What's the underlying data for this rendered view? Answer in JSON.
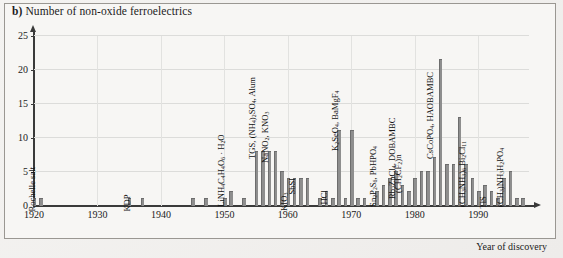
{
  "figure": {
    "panel_letter": "b)",
    "title": "Number of non-oxide ferroelectrics",
    "xaxis_title": "Year of discovery"
  },
  "chart_data": {
    "type": "bar",
    "title": "b) Number of non-oxide ferroelectrics",
    "xlabel": "Year of discovery",
    "ylabel": "Number of non-oxide ferroelectrics",
    "xlim": [
      1920,
      1998
    ],
    "ylim": [
      0,
      25
    ],
    "yticks": [
      0,
      5,
      10,
      15,
      20,
      25
    ],
    "xticks": [
      1920,
      1930,
      1940,
      1950,
      1960,
      1970,
      1980,
      1990
    ],
    "grid": true,
    "legend": "none",
    "bar_color": "#8e8e8e",
    "x": [
      1920,
      1921,
      1935,
      1937,
      1945,
      1947,
      1950,
      1951,
      1953,
      1955,
      1956,
      1957,
      1958,
      1959,
      1960,
      1961,
      1962,
      1963,
      1965,
      1966,
      1967,
      1968,
      1969,
      1970,
      1971,
      1972,
      1974,
      1975,
      1976,
      1977,
      1978,
      1979,
      1980,
      1981,
      1982,
      1983,
      1984,
      1985,
      1986,
      1987,
      1988,
      1989,
      1990,
      1991,
      1992,
      1993,
      1994,
      1995,
      1996,
      1997
    ],
    "values": [
      1,
      1,
      1,
      1,
      1,
      1,
      1,
      2,
      1,
      8,
      8,
      8,
      8,
      5,
      4,
      4,
      4,
      4,
      1,
      2,
      1,
      11,
      1,
      11,
      1,
      1,
      2,
      3,
      4,
      5,
      3,
      2,
      4,
      5,
      5,
      7,
      21.5,
      6,
      6,
      13,
      6,
      4,
      2,
      3,
      2,
      1,
      4,
      5,
      1,
      1
    ],
    "annotations": [
      {
        "year": 1920,
        "text": "Rochelle salt"
      },
      {
        "year": 1935,
        "text": "KDP"
      },
      {
        "year": 1950,
        "text": "LiNH4C4H4O6 · H2O"
      },
      {
        "year": 1955,
        "text": "TGS, (NH4)2SO4, Alum"
      },
      {
        "year": 1957,
        "text": "NaNO2, KNO3"
      },
      {
        "year": 1960,
        "text": "KIO3"
      },
      {
        "year": 1961,
        "text": "SbSI"
      },
      {
        "year": 1966,
        "text": "HCl"
      },
      {
        "year": 1968,
        "text": "K2SeO4, BaMgF4"
      },
      {
        "year": 1974,
        "text": "Sn2P2S6, PbHPO4"
      },
      {
        "year": 1977,
        "text": "Rb2ZnCl4, DOBAMBC"
      },
      {
        "year": 1978,
        "text": "(CH2CF2)n"
      },
      {
        "year": 1983,
        "text": "CsCoPO4, HAOBAMBC"
      },
      {
        "year": 1988,
        "text": "(CH3NH3)6 Bi2Cl11"
      },
      {
        "year": 1991,
        "text": "TlS"
      },
      {
        "year": 1994,
        "text": "(CH3)NH3H2PO4"
      }
    ]
  },
  "yticks": {
    "t0": "0",
    "t5": "5",
    "t10": "10",
    "t15": "15",
    "t20": "20",
    "t25": "25"
  },
  "xticks": {
    "t1920": "1920",
    "t1930": "1930",
    "t1940": "1940",
    "t1950": "1950",
    "t1960": "1960",
    "t1970": "1970",
    "t1980": "1980",
    "t1990": "1990"
  }
}
